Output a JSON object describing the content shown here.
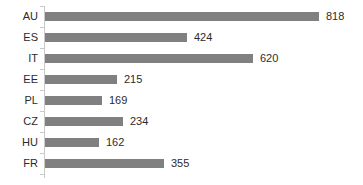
{
  "chart_data": {
    "type": "bar",
    "orientation": "horizontal",
    "title": "",
    "xlabel": "",
    "ylabel": "",
    "grid": false,
    "legend": false,
    "xlim": [
      0,
      818
    ],
    "categories": [
      "AU",
      "ES",
      "IT",
      "EE",
      "PL",
      "CZ",
      "HU",
      "FR"
    ],
    "values": [
      818,
      424,
      620,
      215,
      169,
      234,
      162,
      355
    ],
    "value_labels": [
      "818",
      "424",
      "620",
      "215",
      "169",
      "234",
      "162",
      "355"
    ],
    "bar_color": "#808080",
    "text_color": "#2b2b2b",
    "axis_color": "#c9c9c9",
    "background_color": "#ffffff"
  }
}
